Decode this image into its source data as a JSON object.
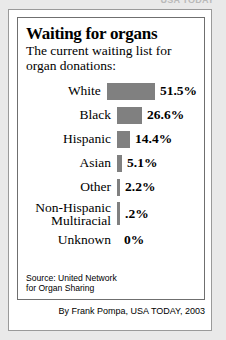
{
  "top_cut_text": "USA TODAY",
  "card": {
    "title": "Waiting for organs",
    "subtitle": "The current waiting list for\norgan donations:",
    "source": "Source: United Network\nfor Organ Sharing",
    "byline": "By Frank Pompa, USA TODAY, 2003"
  },
  "colors": {
    "bar": "#808080",
    "page_background": "#e9e9e9",
    "card_background": "#ffffff",
    "border": "#6f6f6f"
  },
  "chart_data": {
    "type": "bar",
    "orientation": "horizontal",
    "title": "Waiting for organs",
    "subtitle": "The current waiting list for organ donations:",
    "xlabel": "",
    "ylabel": "",
    "xlim": [
      0,
      51.5
    ],
    "grid": false,
    "legend": false,
    "source": "United Network for Organ Sharing",
    "categories": [
      "White",
      "Black",
      "Hispanic",
      "Asian",
      "Other",
      "Non-Hispanic Multiracial",
      "Unknown"
    ],
    "values": [
      51.5,
      26.6,
      14.4,
      5.1,
      2.2,
      0.2,
      0
    ],
    "value_labels": [
      "51.5%",
      "26.6%",
      "14.4%",
      "5.1%",
      "2.2%",
      ".2%",
      "0%"
    ],
    "bar_pixel_widths": [
      48,
      25,
      13,
      5,
      3,
      3,
      0
    ]
  },
  "rows": [
    {
      "label": "White",
      "value": "51.5%",
      "width": 48,
      "tall": false
    },
    {
      "label": "Black",
      "value": "26.6%",
      "width": 25,
      "tall": false
    },
    {
      "label": "Hispanic",
      "value": "14.4%",
      "width": 13,
      "tall": false
    },
    {
      "label": "Asian",
      "value": "5.1%",
      "width": 5,
      "tall": false
    },
    {
      "label": "Other",
      "value": "2.2%",
      "width": 3,
      "tall": false
    },
    {
      "label": "Non-Hispanic\nMultiracial",
      "value": ".2%",
      "width": 3,
      "tall": true
    },
    {
      "label": "Unknown",
      "value": "0%",
      "width": 0,
      "tall": false
    }
  ]
}
